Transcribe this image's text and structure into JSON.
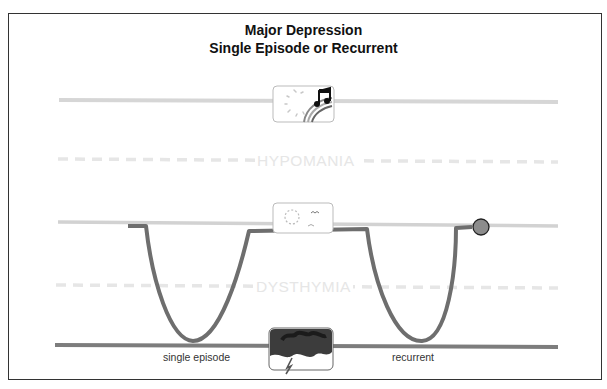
{
  "title": {
    "line1": "Major Depression",
    "line2": "Single Episode or Recurrent"
  },
  "levels": {
    "hypomania": "HYPOMANIA",
    "dysthymia": "DYSTHYMIA"
  },
  "captions": {
    "single": "single episode",
    "recurrent": "recurrent"
  },
  "icons": {
    "top": "mania-sun-music-rainbow-icon",
    "middle": "normal-sun-bird-icon",
    "bottom": "depression-dark-clouds-icon"
  },
  "colors": {
    "mood_curve": "#6e6e6e",
    "top_line": "#d6d6d6",
    "mid_line": "#d0d0d0",
    "bottom_line": "#7a7a7a",
    "dashed": "#e4e4e4",
    "marker": "#8a8a8a"
  }
}
